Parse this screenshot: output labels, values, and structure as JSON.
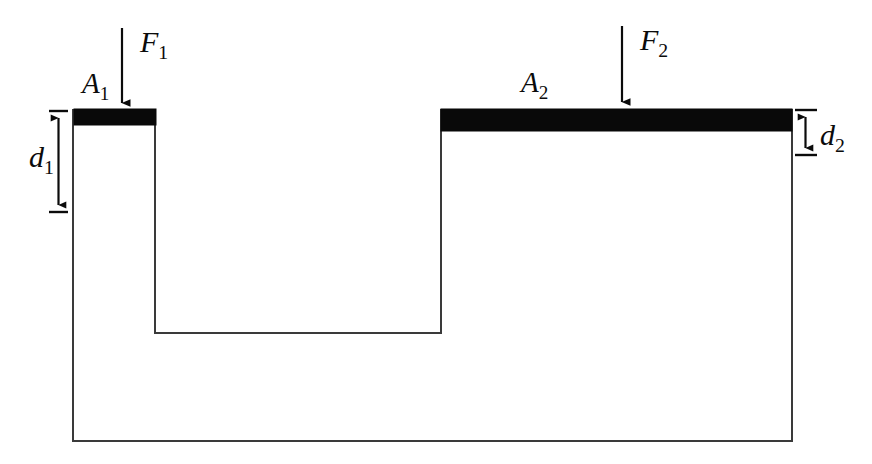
{
  "figure": {
    "type": "physics-schematic",
    "background_color": "#ffffff",
    "outline_color": "#3a3a3a",
    "piston_color": "#090909",
    "label_color": "#0b0b0b"
  },
  "labels": {
    "force_left": {
      "symbol": "F",
      "subscript": "1",
      "text": "F1"
    },
    "force_right": {
      "symbol": "F",
      "subscript": "2",
      "text": "F2"
    },
    "area_left": {
      "symbol": "A",
      "subscript": "1",
      "text": "A1"
    },
    "area_right": {
      "symbol": "A",
      "subscript": "2",
      "text": "A2"
    },
    "depth_left": {
      "symbol": "d",
      "subscript": "1",
      "text": "d1"
    },
    "depth_right": {
      "symbol": "d",
      "subscript": "2",
      "text": "d2"
    }
  },
  "geometry": {
    "vessel_left_x": 73,
    "vessel_right_x": 792,
    "vessel_bottom_y": 441,
    "left_chamber_right_x": 155,
    "ledge_y": 333,
    "right_chamber_left_x": 441,
    "left_surface_y": 110,
    "right_surface_y": 110,
    "piston_left": {
      "x": 74,
      "y": 109,
      "width": 82,
      "height": 16
    },
    "piston_right": {
      "x": 441,
      "y": 109,
      "width": 351,
      "height": 22
    },
    "arrow_left": {
      "x": 122,
      "y_start": 28,
      "y_end": 109
    },
    "arrow_right": {
      "x": 622,
      "y_start": 26,
      "y_end": 108
    },
    "dim_left": {
      "x": 58,
      "y_top": 111,
      "y_bottom": 212,
      "tick_x1": 49,
      "tick_x2": 68
    },
    "dim_right": {
      "x": 805,
      "y_top": 112,
      "y_bottom": 153,
      "tick_x1": 795,
      "tick_x2": 817
    }
  }
}
